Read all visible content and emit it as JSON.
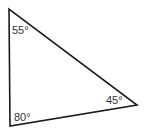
{
  "diagram": {
    "shape": "triangle",
    "stroke_color": "#1a1a1a",
    "vertices": {
      "top": {
        "x": 9,
        "y": 9
      },
      "bottom_left": {
        "x": 10,
        "y": 126
      },
      "right": {
        "x": 137,
        "y": 105
      }
    },
    "angles": [
      {
        "vertex": "top",
        "label": "55°"
      },
      {
        "vertex": "right",
        "label": "45°"
      },
      {
        "vertex": "bottom_left",
        "label": "80°"
      }
    ]
  }
}
